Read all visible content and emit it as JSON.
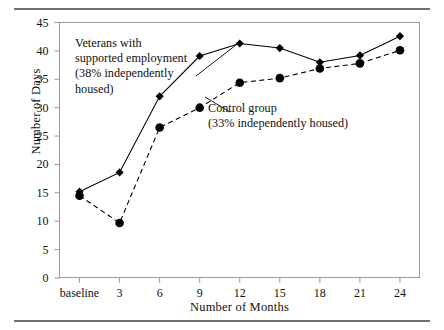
{
  "chart_data": {
    "type": "line",
    "title": "",
    "xlabel": "Number of Months",
    "ylabel": "Number of Days",
    "categories": [
      "baseline",
      "3",
      "6",
      "9",
      "12",
      "15",
      "18",
      "21",
      "24"
    ],
    "ylim": [
      0,
      45
    ],
    "yticks": [
      0,
      5,
      10,
      15,
      20,
      25,
      30,
      35,
      40,
      45
    ],
    "grid": false,
    "legend_position": "inline-annotation",
    "series": [
      {
        "name": "Veterans with supported employment",
        "marker": "diamond",
        "linestyle": "solid",
        "color": "#000000",
        "values": [
          15.2,
          18.6,
          32.0,
          39.1,
          41.3,
          40.5,
          38.0,
          39.2,
          42.6
        ]
      },
      {
        "name": "Control group",
        "marker": "circle",
        "linestyle": "dashed",
        "color": "#000000",
        "values": [
          14.5,
          9.7,
          26.5,
          30.0,
          34.4,
          35.2,
          36.9,
          37.8,
          40.1
        ]
      }
    ],
    "annotations": [
      {
        "id": "veterans",
        "lines": [
          "Veterans with",
          "supported employment",
          "(38% independently",
          "housed)"
        ],
        "text": "Veterans with supported employment (38% independently housed)"
      },
      {
        "id": "control",
        "lines": [
          "Control group",
          "(33% independently housed)"
        ],
        "text": "Control group (33% independently housed)"
      }
    ]
  },
  "figure": {
    "axis_color": "#9a9a9a",
    "rule_color": "#6f6f6f",
    "background": "#ffffff"
  }
}
